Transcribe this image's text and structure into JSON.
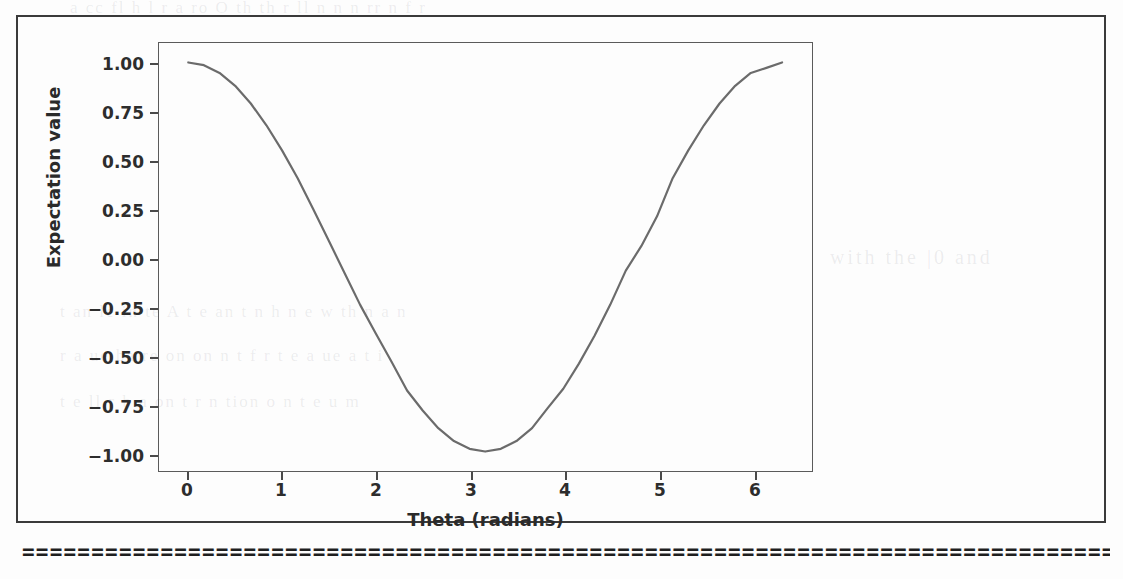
{
  "page": {
    "background_color": "#fdfdfd",
    "frame_color": "#3a3a3a",
    "separator_rule": "=========================================================================================================="
  },
  "ghost_text": {
    "top_line": "a cc  fl  h  l  r  a ro    O    th  th  r  ll  n   n   n  rr n f   r",
    "mid_line": "with the |0 and",
    "line2": "t   an  le  in  te   A   t  e    an    t   n  h n  e   w  th  n  a  n",
    "line3": "r  a ue   ba   re   on   on  n  t   f r  t   e  a ue    a   t  i",
    "line4": "t  e  ll  r      b  a    on   t  r  n   tion  o   n  t  e  u  m"
  },
  "chart_data": {
    "type": "line",
    "title": "",
    "xlabel": "Theta (radians)",
    "ylabel": "Expectation value",
    "xlim": [
      -0.31,
      6.6
    ],
    "ylim": [
      -1.1,
      1.1
    ],
    "grid": false,
    "legend": null,
    "line_color": "#6b6b6b",
    "line_width": 2.2,
    "xticks": [
      0,
      1,
      2,
      3,
      4,
      5,
      6
    ],
    "xtick_labels": [
      "0",
      "1",
      "2",
      "3",
      "4",
      "5",
      "6"
    ],
    "yticks": [
      1.0,
      0.75,
      0.5,
      0.25,
      0.0,
      -0.25,
      -0.5,
      -0.75,
      -1.0
    ],
    "ytick_labels": [
      "1.00",
      "0.75",
      "0.50",
      "0.25",
      "0.00",
      "−0.25",
      "−0.50",
      "−0.75",
      "−1.00"
    ],
    "series": [
      {
        "name": "cos(theta)",
        "x": [
          0.0,
          0.1653,
          0.3307,
          0.496,
          0.6614,
          0.8267,
          0.992,
          1.1574,
          1.3227,
          1.4881,
          1.6534,
          1.8187,
          1.9841,
          2.1494,
          2.3148,
          2.4801,
          2.6454,
          2.8108,
          2.9761,
          3.1415,
          3.3068,
          3.4722,
          3.6375,
          3.8028,
          3.9682,
          4.1335,
          4.2989,
          4.4642,
          4.6295,
          4.7949,
          4.9602,
          5.1256,
          5.2909,
          5.4562,
          5.6216,
          5.7869,
          5.9523,
          6.1176,
          6.2832
        ],
        "y": [
          1.0,
          0.986,
          0.946,
          0.88,
          0.789,
          0.677,
          0.548,
          0.405,
          0.246,
          0.082,
          -0.082,
          -0.246,
          -0.393,
          -0.537,
          -0.686,
          -0.789,
          -0.88,
          -0.946,
          -0.986,
          -1.0,
          -0.986,
          -0.946,
          -0.88,
          -0.777,
          -0.677,
          -0.548,
          -0.405,
          -0.246,
          -0.07,
          0.057,
          0.209,
          0.405,
          0.548,
          0.677,
          0.789,
          0.88,
          0.946,
          0.972,
          1.0
        ]
      }
    ]
  }
}
